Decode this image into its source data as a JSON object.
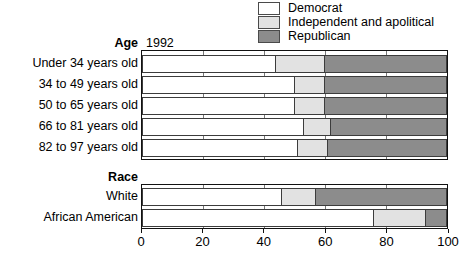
{
  "chart_data": {
    "type": "bar",
    "subtype": "stacked-horizontal-100",
    "title": "",
    "xlabel": "",
    "ylabel": "",
    "xlim": [
      0,
      100
    ],
    "xticks": [
      0,
      20,
      40,
      60,
      80,
      100
    ],
    "grid": true,
    "legend_position": "top-right",
    "year": "1992",
    "series": [
      {
        "name": "Democrat",
        "color": "#ffffff"
      },
      {
        "name": "Independent and apolitical",
        "color": "#e2e2e2"
      },
      {
        "name": "Republican",
        "color": "#8c8c8c"
      }
    ],
    "groups": [
      {
        "name": "Age",
        "categories": [
          "Under 34 years old",
          "34 to 49 years old",
          "50 to 65 years old",
          "66 to 81 years old",
          "82 to 97 years old"
        ],
        "values": [
          [
            44,
            16,
            40
          ],
          [
            50,
            10,
            40
          ],
          [
            50,
            10,
            40
          ],
          [
            53,
            9,
            38
          ],
          [
            51,
            10,
            39
          ]
        ]
      },
      {
        "name": "Race",
        "categories": [
          "White",
          "African American"
        ],
        "values": [
          [
            46,
            11,
            43
          ],
          [
            76,
            17,
            7
          ]
        ]
      }
    ]
  },
  "legend": {
    "items": [
      {
        "label": "Democrat"
      },
      {
        "label": "Independent and apolitical"
      },
      {
        "label": "Republican"
      }
    ]
  },
  "axis": {
    "labels": [
      "0",
      "20",
      "40",
      "60",
      "80",
      "100"
    ]
  }
}
